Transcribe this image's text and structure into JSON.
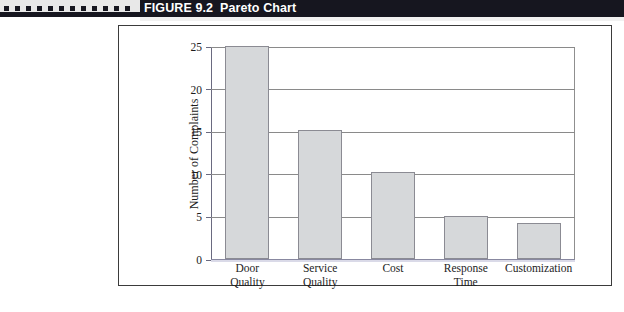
{
  "header": {
    "figure_number": "FIGURE 9.2",
    "title": "Pareto Chart",
    "decor_square_count": 12,
    "bar_color": "#16161f",
    "title_color": "#ffffff"
  },
  "chart_data": {
    "type": "bar",
    "title": "",
    "xlabel": "",
    "ylabel": "Number of Complaints",
    "categories": [
      "Door\nQuality",
      "Service\nQuality",
      "Cost",
      "Response\nTime",
      "Customization"
    ],
    "values": [
      25,
      15.2,
      10.2,
      5.1,
      4.2
    ],
    "ylim": [
      0,
      25
    ],
    "yticks": [
      0,
      5,
      10,
      15,
      20,
      25
    ],
    "ytick_labels": [
      "0",
      "5",
      "10",
      "15",
      "20",
      "25"
    ],
    "grid": true,
    "legend": false,
    "bar_fill": "#d6d8da",
    "bar_edge": "#8b8b93",
    "frame_color": "#3b3b3b"
  }
}
